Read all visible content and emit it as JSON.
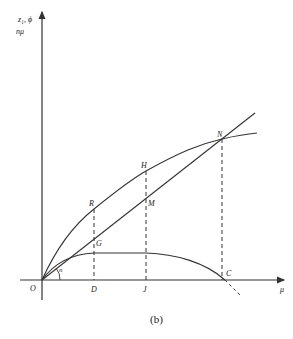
{
  "diagram": {
    "caption": "(b)",
    "axes": {
      "y_label_line1": "z₁,  ϕ",
      "y_label_line2": "nμ",
      "x_label": "μ"
    },
    "points": {
      "origin": "O",
      "D": "D",
      "J": "J",
      "C": "C",
      "R": "R",
      "G": "G",
      "H": "H",
      "M": "M",
      "N": "N"
    },
    "angle_label": "n",
    "colors": {
      "stroke": "#333333",
      "background": "#ffffff"
    }
  }
}
